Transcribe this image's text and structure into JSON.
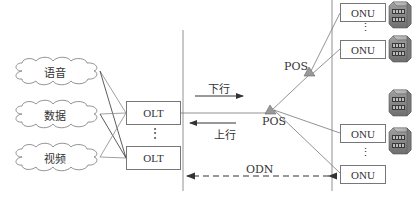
{
  "diagram": {
    "type": "PON network architecture",
    "sources": [
      {
        "id": "voice",
        "label": "语音"
      },
      {
        "id": "data",
        "label": "数据"
      },
      {
        "id": "video",
        "label": "视频"
      }
    ],
    "olts": [
      {
        "label": "OLT"
      },
      {
        "label": "OLT"
      }
    ],
    "olt_ellipsis": "⋮",
    "directions": {
      "downstream": "下行",
      "upstream": "上行"
    },
    "splitters": [
      {
        "label": "POS",
        "position": "main"
      },
      {
        "label": "POS",
        "position": "secondary"
      }
    ],
    "onus": [
      {
        "label": "ONU"
      },
      {
        "label": "ONU"
      },
      {
        "label": "ONU"
      },
      {
        "label": "ONU"
      }
    ],
    "onu_ellipsis": "⋮",
    "odn_label": "ODN",
    "colors": {
      "line": "#777777",
      "dark_line": "#333333",
      "splitter_fill": "#999999",
      "server_body": "#8a8a8a"
    }
  }
}
